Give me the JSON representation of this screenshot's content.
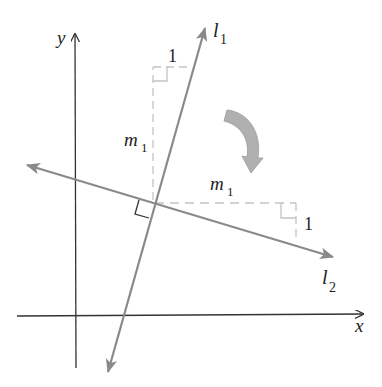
{
  "diagram": {
    "labels": {
      "y_axis": "y",
      "x_axis": "x",
      "line1": "l",
      "line1_sub": "1",
      "line2": "l",
      "line2_sub": "2",
      "upper_rise": "m",
      "upper_rise_sub": "1",
      "upper_run": "1",
      "lower_run": "m",
      "lower_run_sub": "1",
      "lower_rise": "1"
    },
    "colors": {
      "axes": "#333333",
      "lines": "#8a8a8a",
      "dashed": "#c4c4c4",
      "rotation_arrow": "#b0b0b0",
      "right_angle": "#333333"
    },
    "rotation": "clockwise 90 degrees"
  }
}
